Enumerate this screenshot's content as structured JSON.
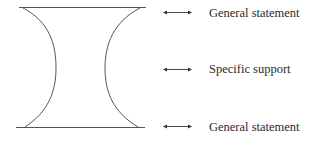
{
  "diagram": {
    "shape": "hourglass-funnel",
    "stroke_color": "#555555",
    "rows": [
      {
        "label": "General statement",
        "connector": "double-arrow-icon"
      },
      {
        "label": "Specific support",
        "connector": "double-arrow-icon"
      },
      {
        "label": "General statement",
        "connector": "double-arrow-icon"
      }
    ]
  }
}
